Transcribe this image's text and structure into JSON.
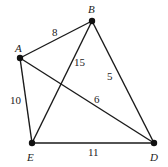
{
  "graph": {
    "nodes": {
      "A": {
        "label": "A",
        "x": 20,
        "y": 58,
        "lx": 15,
        "ly": 52
      },
      "B": {
        "label": "B",
        "x": 92,
        "y": 21,
        "lx": 88,
        "ly": 13
      },
      "E": {
        "label": "E",
        "x": 32,
        "y": 143,
        "lx": 27,
        "ly": 161
      },
      "D": {
        "label": "D",
        "x": 154,
        "y": 143,
        "lx": 150,
        "ly": 161
      }
    },
    "edges": [
      {
        "from": "A",
        "to": "B",
        "weight": "8",
        "wx": 52,
        "wy": 36
      },
      {
        "from": "A",
        "to": "E",
        "weight": "10",
        "wx": 10,
        "wy": 104
      },
      {
        "from": "A",
        "to": "D",
        "weight": "6",
        "wx": 94,
        "wy": 103
      },
      {
        "from": "B",
        "to": "E",
        "weight": "15",
        "wx": 74,
        "wy": 66
      },
      {
        "from": "B",
        "to": "D",
        "weight": "5",
        "wx": 107,
        "wy": 80
      },
      {
        "from": "E",
        "to": "D",
        "weight": "11",
        "wx": 88,
        "wy": 156
      }
    ]
  }
}
